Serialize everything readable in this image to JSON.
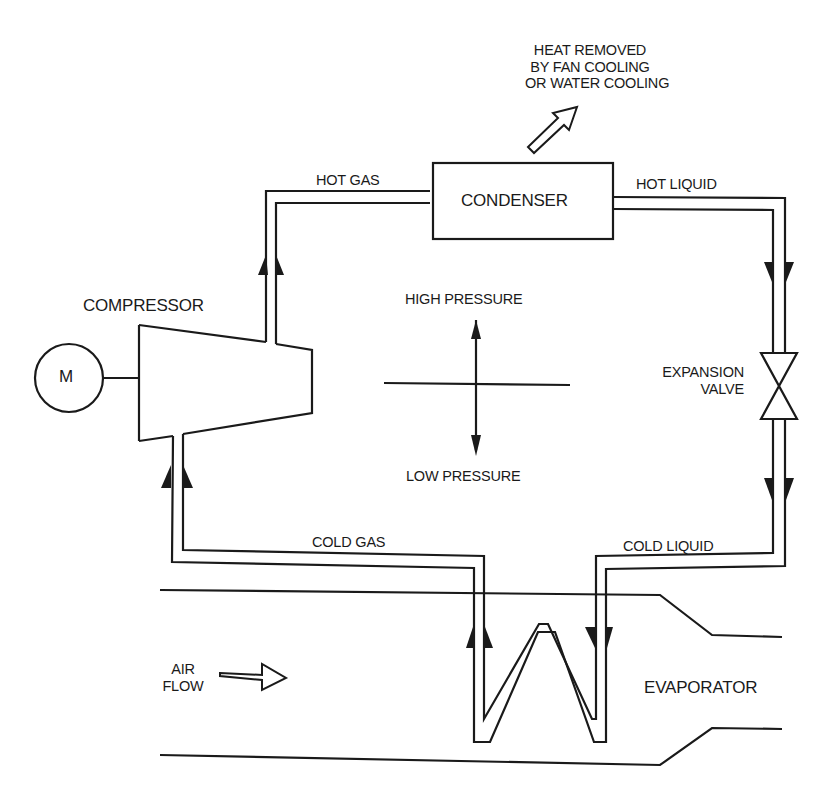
{
  "diagram": {
    "type": "refrigeration-cycle",
    "line_color": "#1a1a1a",
    "background": "#ffffff"
  },
  "labels": {
    "heat_removed": [
      "HEAT REMOVED",
      "BY FAN COOLING",
      "OR WATER COOLING"
    ],
    "hot_gas": "HOT GAS",
    "condenser": "CONDENSER",
    "hot_liquid": "HOT LIQUID",
    "compressor": "COMPRESSOR",
    "motor": "M",
    "high_pressure": "HIGH PRESSURE",
    "low_pressure": "LOW PRESSURE",
    "expansion_valve": [
      "EXPANSION",
      "VALVE"
    ],
    "cold_gas": "COLD GAS",
    "cold_liquid": "COLD LIQUID",
    "air_flow": [
      "AIR",
      "FLOW"
    ],
    "evaporator": "EVAPORATOR"
  },
  "components": [
    {
      "name": "motor",
      "icon": "motor-circle"
    },
    {
      "name": "compressor",
      "icon": "trapezoid"
    },
    {
      "name": "condenser",
      "icon": "rectangle"
    },
    {
      "name": "expansion-valve",
      "icon": "bowtie-valve"
    },
    {
      "name": "evaporator",
      "icon": "zigzag-coil"
    }
  ],
  "flow": [
    "COMPRESSOR",
    "HOT GAS",
    "CONDENSER",
    "HOT LIQUID",
    "EXPANSION VALVE",
    "COLD LIQUID",
    "EVAPORATOR",
    "COLD GAS",
    "COMPRESSOR"
  ]
}
